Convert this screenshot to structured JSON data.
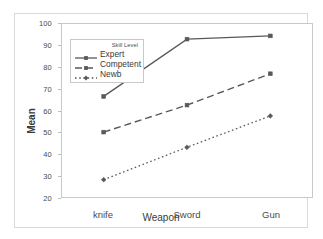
{
  "chart_data": {
    "type": "line",
    "title": "",
    "xlabel": "Weapon",
    "ylabel": "Mean",
    "categories": [
      "knife",
      "Sword",
      "Gun"
    ],
    "ylim": [
      20,
      100
    ],
    "yticks": [
      20,
      30,
      40,
      50,
      60,
      70,
      80,
      90,
      100
    ],
    "grid": false,
    "legend_title": "Skill Level",
    "legend_position": "upper-left-inside",
    "series": [
      {
        "name": "Expert",
        "values": [
          66.5,
          93.0,
          94.5
        ],
        "style": "solid",
        "marker": "square"
      },
      {
        "name": "Competent",
        "values": [
          50.0,
          62.5,
          77.0
        ],
        "style": "dashed",
        "marker": "square"
      },
      {
        "name": "Newb",
        "values": [
          28.0,
          43.0,
          57.5
        ],
        "style": "dotted",
        "marker": "diamond"
      }
    ],
    "colors": {
      "line": "#595959",
      "frame": "#c9c9c9",
      "text": "#3a3a3a"
    }
  }
}
